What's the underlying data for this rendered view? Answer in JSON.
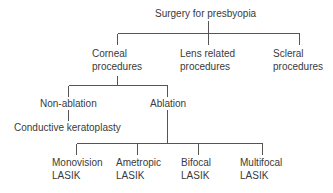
{
  "diagram": {
    "type": "tree",
    "root": {
      "label": "Surgery for presbyopia",
      "children": [
        {
          "label_lines": [
            "Corneal",
            "procedures"
          ],
          "children": [
            {
              "label": "Non-ablation",
              "children": [
                {
                  "label": "Conductive keratoplasty"
                }
              ]
            },
            {
              "label": "Ablation",
              "children": [
                {
                  "label_lines": [
                    "Monovision",
                    "LASIK"
                  ]
                },
                {
                  "label_lines": [
                    "Ametropic",
                    "LASIK"
                  ]
                },
                {
                  "label_lines": [
                    "Bifocal",
                    "LASIK"
                  ]
                },
                {
                  "label_lines": [
                    "Multifocal",
                    "LASIK"
                  ]
                }
              ]
            }
          ]
        },
        {
          "label_lines": [
            "Lens related",
            "procedures"
          ]
        },
        {
          "label_lines": [
            "Scleral",
            "procedures"
          ]
        }
      ]
    }
  },
  "nodes": {
    "root": "Surgery for presbyopia",
    "corneal": [
      "Corneal",
      "procedures"
    ],
    "lens": [
      "Lens related",
      "procedures"
    ],
    "scleral": [
      "Scleral",
      "procedures"
    ],
    "non_ablation": "Non-ablation",
    "ablation": "Ablation",
    "conductive": "Conductive keratoplasty",
    "monovision": [
      "Monovision",
      "LASIK"
    ],
    "ametropic": [
      "Ametropic",
      "LASIK"
    ],
    "bifocal": [
      "Bifocal",
      "LASIK"
    ],
    "multifocal": [
      "Multifocal",
      "LASIK"
    ]
  },
  "colors": {
    "text": "#3a3a3a",
    "lines": "#555555",
    "background": "#ffffff"
  }
}
